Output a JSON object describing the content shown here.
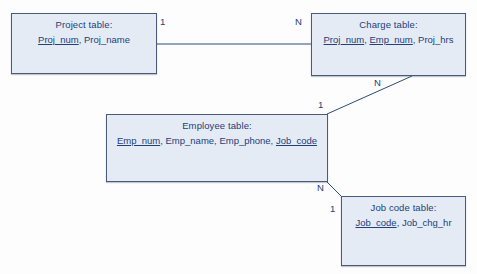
{
  "diagram": {
    "type": "entity-relationship-diagram",
    "colors": {
      "box_fill": "#e4ebf4",
      "box_border": "#4a5a78",
      "text": "#23407a",
      "connector": "#2d4a74",
      "background": "#fdfdfd"
    },
    "entities": [
      {
        "id": "project",
        "title": "Project table:",
        "attributes": [
          {
            "name": "Proj_num",
            "key": true
          },
          {
            "name": "Proj_name",
            "key": false
          }
        ]
      },
      {
        "id": "charge",
        "title": "Charge table:",
        "attributes": [
          {
            "name": "Proj_num",
            "key": true
          },
          {
            "name": "Emp_num",
            "key": true
          },
          {
            "name": "Proj_hrs",
            "key": false
          }
        ]
      },
      {
        "id": "employee",
        "title": "Employee table:",
        "attributes": [
          {
            "name": "Emp_num",
            "key": true
          },
          {
            "name": "Emp_name",
            "key": false
          },
          {
            "name": "Emp_phone",
            "key": false
          },
          {
            "name": "Job_code",
            "key": true
          }
        ]
      },
      {
        "id": "jobcode",
        "title": "Job code table:",
        "attributes": [
          {
            "name": "Job_code",
            "key": true
          },
          {
            "name": "Job_chg_hr",
            "key": false
          }
        ]
      }
    ],
    "relationships": [
      {
        "id": "project-charge",
        "from": "project",
        "to": "charge",
        "from_cardinality": "1",
        "to_cardinality": "N"
      },
      {
        "id": "employee-charge",
        "from": "employee",
        "to": "charge",
        "from_cardinality": "1",
        "to_cardinality": "N"
      },
      {
        "id": "jobcode-employee",
        "from": "jobcode",
        "to": "employee",
        "from_cardinality": "1",
        "to_cardinality": "N"
      }
    ],
    "labels": {
      "project_one": "1",
      "charge_many": "N",
      "charge_many_lower": "N",
      "employee_one": "1",
      "employee_many": "N",
      "jobcode_one": "1"
    },
    "entity_text": {
      "project": {
        "title": "Project table:",
        "attr_0": "Proj_num",
        "sep_0": ", ",
        "attr_1": "Proj_name"
      },
      "charge": {
        "title": "Charge table:",
        "attr_0": "Proj_num",
        "sep_0": ", ",
        "attr_1": "Emp_num",
        "sep_1": ", ",
        "attr_2": "Proj_hrs"
      },
      "employee": {
        "title": "Employee table:",
        "attr_0": "Emp_num",
        "sep_0": ", ",
        "attr_1": "Emp_name",
        "sep_1": ", ",
        "attr_2": "Emp_phone",
        "sep_2": ", ",
        "attr_3": "Job_code"
      },
      "jobcode": {
        "title": "Job code table:",
        "attr_0": "Job_code",
        "sep_0": ", ",
        "attr_1": "Job_chg_hr"
      }
    }
  }
}
